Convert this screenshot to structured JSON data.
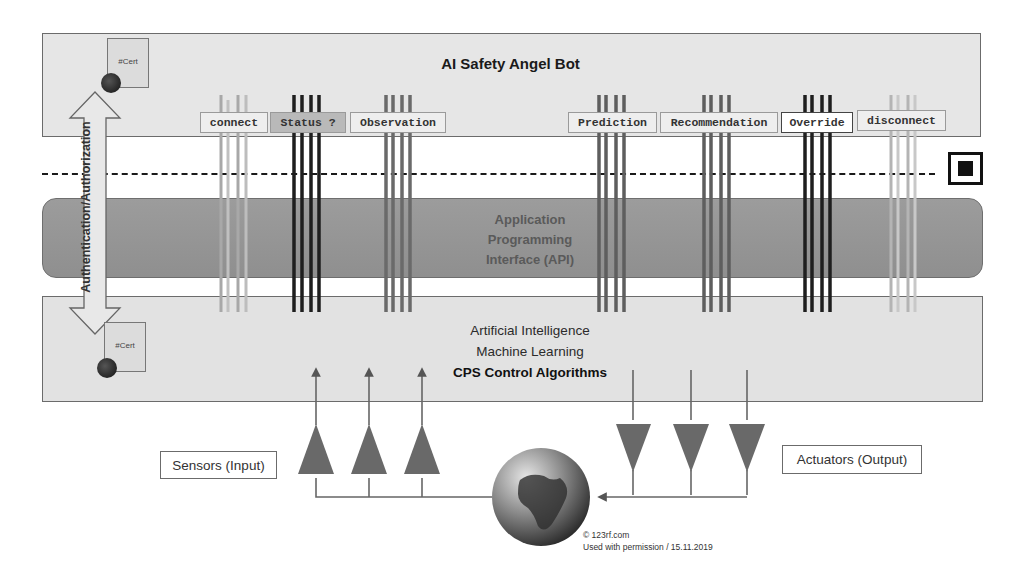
{
  "diagram": {
    "top_layer": {
      "title": "AI Safety Angel Bot"
    },
    "api_layer": {
      "lines": [
        "Application",
        "Programming",
        "Interface (API)"
      ]
    },
    "bottom_layer": {
      "lines": [
        "Artificial Intelligence",
        "Machine Learning"
      ],
      "bold_line": "CPS Control Algorithms"
    },
    "auth_arrow": {
      "label": "Authentication/Authorization"
    },
    "certificates": [
      {
        "label": "#Cert"
      },
      {
        "label": "#Cert"
      }
    ],
    "api_calls": [
      {
        "label": "connect",
        "style": "light"
      },
      {
        "label": "Status ?",
        "style": "dark"
      },
      {
        "label": "Observation",
        "style": "light"
      },
      {
        "label": "Prediction",
        "style": "light"
      },
      {
        "label": "Recommendation",
        "style": "light"
      },
      {
        "label": "Override",
        "style": "white"
      },
      {
        "label": "disconnect",
        "style": "light"
      }
    ],
    "sensors_label": "Sensors (Input)",
    "actuators_label": "Actuators (Output)",
    "credit": {
      "line1": "© 123rf.com",
      "line2": "Used with permission / 15.11.2019"
    },
    "colors": {
      "panel": "#e6e6e6",
      "api": "#979797",
      "triangle": "#6a6a6a",
      "dark_arrow": "#1e1e1e",
      "mid_arrow": "#6a6a6a",
      "light_arrow": "#a8a8a8"
    }
  }
}
